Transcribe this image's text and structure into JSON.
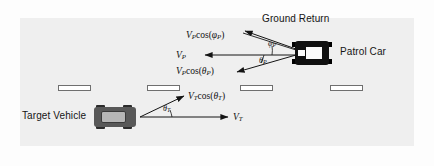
{
  "figure": {
    "type": "vector-diagram",
    "background_color": "#efefef",
    "page_color": "#ffffff",
    "line_color": "#1a1a1a"
  },
  "labels": {
    "ground_return": "Ground Return",
    "patrol_car": "Patrol Car",
    "target_vehicle": "Target Vehicle"
  },
  "math_labels": {
    "vp_cos_phi_p": {
      "v": "V",
      "v_sub": "P",
      "fn": "cos(",
      "sym": "φ",
      "sym_sub": "P",
      "close": ")"
    },
    "vp": {
      "v": "V",
      "v_sub": "P"
    },
    "vp_cos_th_p": {
      "v": "V",
      "v_sub": "P",
      "fn": "cos(",
      "sym": "θ",
      "sym_sub": "P",
      "close": ")"
    },
    "vt_cos_th_t": {
      "v": "V",
      "v_sub": "T",
      "fn": "cos(",
      "sym": "θ",
      "sym_sub": "T",
      "close": ")"
    },
    "vt": {
      "v": "V",
      "v_sub": "T"
    }
  },
  "angles": {
    "phi_p": {
      "sym": "φ",
      "sub": "P"
    },
    "theta_p": {
      "sym": "θ",
      "sub": "P"
    },
    "theta_t": {
      "sym": "θ",
      "sub": "T"
    }
  },
  "lane_markings": [
    {
      "x": 58,
      "y": 85,
      "w": 33
    },
    {
      "x": 147,
      "y": 85,
      "w": 33
    },
    {
      "x": 240,
      "y": 85,
      "w": 33
    },
    {
      "x": 330,
      "y": 85,
      "w": 33
    }
  ],
  "vehicles": {
    "patrol": {
      "name": "patrol-car",
      "color": "#101010"
    },
    "target": {
      "name": "target-vehicle",
      "color": "#585858"
    }
  }
}
